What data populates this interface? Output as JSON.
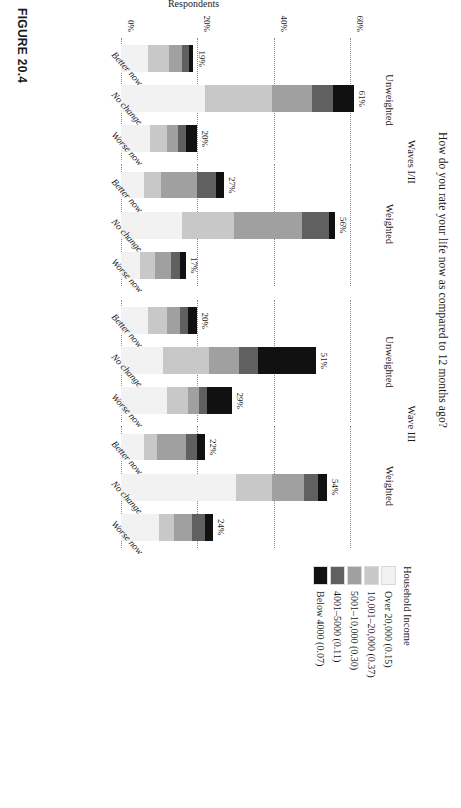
{
  "figure": {
    "title": "How do you rate your life now as compared to 12 months ago?",
    "caption": "FIGURE 20.4"
  },
  "axes": {
    "ylabel": "Respondents",
    "yticks": [
      "0%",
      "20%",
      "40%",
      "60%"
    ],
    "ytick_values": [
      0,
      20,
      40,
      60
    ],
    "ymax": 66
  },
  "legend": {
    "title": "Household Income",
    "items": [
      {
        "label": "Over 20,000 (0.15)",
        "color": "#f2f2f2"
      },
      {
        "label": "10,001–20,000 (0.37)",
        "color": "#c8c8c8"
      },
      {
        "label": "5001–10,000 (0.30)",
        "color": "#a0a0a0"
      },
      {
        "label": "4001–5000 (0.11)",
        "color": "#606060"
      },
      {
        "label": "Below 4000 (0.07)",
        "color": "#111111"
      }
    ]
  },
  "panels": [
    {
      "group": "Waves I/II",
      "subpanels": [
        {
          "name": "Unweighted",
          "categories": [
            "Better now",
            "No change",
            "Worse now"
          ],
          "totals": [
            19,
            61,
            20
          ],
          "labels": [
            "19%",
            "61%",
            "20%"
          ]
        },
        {
          "name": "Weighted",
          "categories": [
            "Better now",
            "No change",
            "Worse now"
          ],
          "totals": [
            27,
            56,
            17
          ],
          "labels": [
            "27%",
            "56%",
            "17%"
          ]
        }
      ]
    },
    {
      "group": "Wave III",
      "subpanels": [
        {
          "name": "Unweighted",
          "categories": [
            "Better now",
            "No change",
            "Worse now"
          ],
          "totals": [
            20,
            51,
            29
          ],
          "labels": [
            "20%",
            "51%",
            "29%"
          ]
        },
        {
          "name": "Weighted",
          "categories": [
            "Better now",
            "No change",
            "Worse now"
          ],
          "totals": [
            22,
            54,
            24
          ],
          "labels": [
            "22%",
            "54%",
            "24%"
          ]
        }
      ]
    }
  ],
  "chart_data": {
    "type": "bar",
    "title": "How do you rate your life now as compared to 12 months ago?",
    "xlabel": "",
    "ylabel": "Respondents",
    "ylim": [
      0,
      66
    ],
    "yticks": [
      0,
      20,
      40,
      60
    ],
    "grid": "dotted horizontal gridlines at 20%, 40%, 60%",
    "stacked": true,
    "legend_title": "Household Income",
    "legend_position": "right",
    "series": [
      {
        "name": "Over 20,000 (0.15)",
        "color": "#f2f2f2"
      },
      {
        "name": "10,001–20,000 (0.37)",
        "color": "#c8c8c8"
      },
      {
        "name": "5001–10,000 (0.30)",
        "color": "#a0a0a0"
      },
      {
        "name": "4001–5000 (0.11)",
        "color": "#606060"
      },
      {
        "name": "Below 4000 (0.07)",
        "color": "#111111"
      }
    ],
    "categories": [
      "Better now",
      "No change",
      "Worse now"
    ],
    "groups": [
      {
        "panel": "Waves I/II",
        "weighting": "Unweighted",
        "totals": [
          19,
          61,
          20
        ],
        "stacks": [
          {
            "category": "Better now",
            "total": 19,
            "segments": [
              7.0,
              5.5,
              3.5,
              1.7,
              1.3
            ]
          },
          {
            "category": "No change",
            "total": 61,
            "segments": [
              22.0,
              17.5,
              10.5,
              5.5,
              5.5
            ]
          },
          {
            "category": "Worse now",
            "total": 20,
            "segments": [
              7.5,
              4.5,
              3.0,
              2.0,
              3.0
            ]
          }
        ]
      },
      {
        "panel": "Waves I/II",
        "weighting": "Weighted",
        "totals": [
          27,
          56,
          17
        ],
        "stacks": [
          {
            "category": "Better now",
            "total": 27,
            "segments": [
              6.0,
              4.5,
              9.5,
              5.0,
              2.0
            ]
          },
          {
            "category": "No change",
            "total": 56,
            "segments": [
              16.0,
              13.5,
              18.0,
              7.0,
              1.5
            ]
          },
          {
            "category": "Worse now",
            "total": 17,
            "segments": [
              5.0,
              4.0,
              4.0,
              2.5,
              1.5
            ]
          }
        ]
      },
      {
        "panel": "Wave III",
        "weighting": "Unweighted",
        "totals": [
          20,
          51,
          29
        ],
        "stacks": [
          {
            "category": "Better now",
            "total": 20,
            "segments": [
              7.0,
              5.0,
              3.5,
              2.0,
              2.5
            ]
          },
          {
            "category": "No change",
            "total": 51,
            "segments": [
              11.0,
              12.0,
              8.0,
              5.0,
              15.0
            ]
          },
          {
            "category": "Worse now",
            "total": 29,
            "segments": [
              12.0,
              5.5,
              3.0,
              2.0,
              6.5
            ]
          }
        ]
      },
      {
        "panel": "Wave III",
        "weighting": "Weighted",
        "totals": [
          22,
          54,
          24
        ],
        "stacks": [
          {
            "category": "Better now",
            "total": 22,
            "segments": [
              6.0,
              3.5,
              7.5,
              3.0,
              2.0
            ]
          },
          {
            "category": "No change",
            "total": 54,
            "segments": [
              30.0,
              9.5,
              8.5,
              3.5,
              2.5
            ]
          },
          {
            "category": "Worse now",
            "total": 24,
            "segments": [
              10.0,
              4.0,
              4.5,
              3.5,
              2.0
            ]
          }
        ]
      }
    ]
  }
}
